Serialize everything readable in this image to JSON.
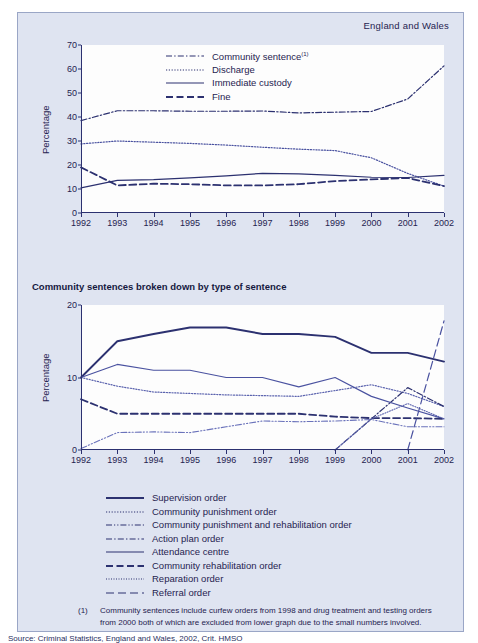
{
  "page": {
    "region_label": "England and Wales",
    "background_color": "#dfe4f1",
    "ink_color": "#2c3170"
  },
  "lower_section": {
    "title": "Community sentences broken down by type of sentence"
  },
  "footnote": {
    "marker": "(1)",
    "text": "Community sentences include curfew orders from 1998 and drug treatment and testing orders from 2000 both of which are excluded from lower graph due to the small numbers involved."
  },
  "source": {
    "text": "Source: Criminal Statistics, England and Wales, 2002, Crit. HMSO"
  },
  "chart_data": [
    {
      "type": "line",
      "title": "",
      "xlabel": "",
      "ylabel": "Percentage",
      "x": [
        1992,
        1993,
        1994,
        1995,
        1996,
        1997,
        1998,
        1999,
        2000,
        2001,
        2002
      ],
      "xticklabels": [
        "1992",
        "1993",
        "1994",
        "1995",
        "1996",
        "1997",
        "1998",
        "1999",
        "2000",
        "2001",
        "2002"
      ],
      "yticklabels": [
        "0",
        "10",
        "20",
        "30",
        "40",
        "50",
        "60",
        "70"
      ],
      "ylim": [
        0,
        70
      ],
      "xlim": [
        1992,
        2002
      ],
      "grid": false,
      "legend_position": "top-center",
      "series": [
        {
          "name": "Community sentence",
          "footnote": "(1)",
          "style": "dash-dot",
          "color": "#2c3170",
          "values": [
            38.5,
            42.6,
            42.6,
            42.4,
            42.4,
            42.5,
            41.7,
            42.0,
            42.5,
            42.3,
            45.5
          ]
        },
        {
          "name": "Discharge",
          "style": "dotted",
          "color": "#4a52a0",
          "values": [
            28.8,
            30.0,
            29.5,
            29.0,
            28.3,
            27.4,
            26.6,
            26.0,
            23.0,
            16.5,
            11.2
          ]
        },
        {
          "name": "Immediate custody",
          "style": "solid",
          "color": "#2c3170",
          "values": [
            10.5,
            13.6,
            13.9,
            14.6,
            15.5,
            16.5,
            16.3,
            15.7,
            14.9,
            14.8,
            15.7
          ]
        },
        {
          "name": "Fine",
          "style": "dashed",
          "color": "#2c3170",
          "values": [
            19.0,
            11.5,
            12.2,
            12.0,
            11.5,
            11.5,
            12.0,
            13.3,
            14.0,
            14.6,
            11.2
          ]
        }
      ],
      "note": "Community sentence line rises steeply after 1999 to about 61 in 2002"
    },
    {
      "type": "line",
      "title": "Community sentences broken down by type of sentence",
      "xlabel": "",
      "ylabel": "Percentage",
      "x": [
        1992,
        1993,
        1994,
        1995,
        1996,
        1997,
        1998,
        1999,
        2000,
        2001,
        2002
      ],
      "xticklabels": [
        "1992",
        "1993",
        "1994",
        "1995",
        "1996",
        "1997",
        "1998",
        "1999",
        "2000",
        "2001",
        "2002"
      ],
      "yticklabels": [
        "0",
        "10",
        "20"
      ],
      "ylim": [
        0,
        20
      ],
      "xlim": [
        1992,
        2002
      ],
      "grid": false,
      "legend_position": "below",
      "series": [
        {
          "name": "Supervision order",
          "style": "solid-thick",
          "color": "#2c3170",
          "values": [
            10.0,
            15.0,
            16.0,
            16.9,
            16.9,
            16.0,
            16.0,
            15.6,
            13.4,
            13.4,
            12.2
          ]
        },
        {
          "name": "Community punishment order",
          "style": "dotted",
          "color": "#5b63ae",
          "values": [
            10.0,
            8.8,
            8.0,
            7.8,
            7.6,
            7.5,
            7.4,
            8.2,
            9.0,
            7.8,
            6.0
          ]
        },
        {
          "name": "Community punishment and rehabilitation order",
          "style": "dash-dot-dot",
          "color": "#6b73bb",
          "values": [
            0.2,
            2.4,
            2.5,
            2.4,
            3.2,
            4.0,
            3.9,
            4.0,
            4.2,
            3.2,
            3.2
          ]
        },
        {
          "name": "Action plan order",
          "style": "dash-dot",
          "color": "#2c3170",
          "values": [
            null,
            null,
            null,
            null,
            null,
            null,
            null,
            0.0,
            4.3,
            8.6,
            6.0
          ]
        },
        {
          "name": "Attendance centre",
          "style": "solid",
          "color": "#4a52a0",
          "values": [
            10.0,
            11.8,
            11.0,
            11.0,
            10.0,
            10.0,
            8.7,
            10.0,
            7.4,
            5.8,
            4.3
          ]
        },
        {
          "name": "Community rehabilitation order",
          "style": "dashed",
          "color": "#2c3170",
          "values": [
            7.0,
            5.0,
            5.0,
            5.0,
            5.0,
            5.0,
            5.0,
            4.6,
            4.4,
            4.4,
            4.3
          ]
        },
        {
          "name": "Reparation order",
          "style": "dotted-fine",
          "color": "#5b63ae",
          "values": [
            null,
            null,
            null,
            null,
            null,
            null,
            null,
            0.0,
            4.3,
            6.4,
            4.3
          ]
        },
        {
          "name": "Referral order",
          "style": "dash-long",
          "color": "#4a52a0",
          "values": [
            null,
            null,
            null,
            null,
            null,
            null,
            null,
            null,
            null,
            0.0,
            17.8
          ]
        }
      ]
    }
  ],
  "legends": {
    "upper": [
      {
        "label": "Community sentence",
        "sup": "(1)",
        "style": "dash-dot"
      },
      {
        "label": "Discharge",
        "sup": "",
        "style": "dotted"
      },
      {
        "label": "Immediate custody",
        "sup": "",
        "style": "solid"
      },
      {
        "label": "Fine",
        "sup": "",
        "style": "dashed"
      }
    ],
    "lower": [
      {
        "label": "Supervision order",
        "style": "solid-thick"
      },
      {
        "label": "Community punishment order",
        "style": "dotted"
      },
      {
        "label": "Community punishment and rehabilitation order",
        "style": "dash-dot-dot"
      },
      {
        "label": "Action plan order",
        "style": "dash-dot"
      },
      {
        "label": "Attendance centre",
        "style": "solid"
      },
      {
        "label": "Community rehabilitation order",
        "style": "dashed"
      },
      {
        "label": "Reparation order",
        "style": "dotted-fine"
      },
      {
        "label": "Referral order",
        "style": "dash-long"
      }
    ]
  }
}
